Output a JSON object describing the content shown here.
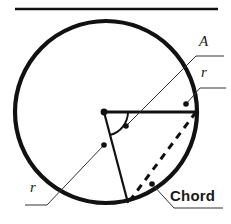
{
  "figure": {
    "background_color": "#ffffff",
    "stroke_color": "#111111",
    "labels": {
      "area": "A",
      "radius_top_right": "r",
      "radius_bottom_left": "r",
      "chord": "Chord"
    },
    "top_rule": {
      "x1": 15,
      "y1": 9,
      "x2": 218,
      "y2": 9,
      "stroke_width": 2.4
    },
    "circle": {
      "cx": 106,
      "cy": 112,
      "r": 91,
      "stroke_width": 4.2,
      "fill": "none"
    },
    "center_point": {
      "cx": 104,
      "cy": 112,
      "r": 3.4
    },
    "radii": [
      {
        "name": "horizontal-radius",
        "x1": 104,
        "y1": 112,
        "x2": 196,
        "y2": 112,
        "stroke_width": 3.2
      },
      {
        "name": "lower-radius",
        "x1": 104,
        "y1": 112,
        "x2": 128,
        "y2": 203,
        "stroke_width": 2.2
      }
    ],
    "angle_arc": {
      "path": "M 128 112 A 24 24 0 0 1 110 135",
      "stroke_width": 1.9
    },
    "chord": {
      "x1": 196,
      "y1": 112,
      "x2": 128,
      "y2": 203,
      "stroke_width": 3.0,
      "dash_pattern": "7 6"
    },
    "leaders": [
      {
        "name": "area-leader",
        "path": "M 126 126 L 196 56 L 224 56",
        "dot": {
          "cx": 126,
          "cy": 126,
          "r": 2.8
        },
        "stroke_width": 1.0
      },
      {
        "name": "radius-top-right-leader",
        "path": "M 186 104 L 200 88 L 226 88",
        "dot": {
          "cx": 186,
          "cy": 104,
          "r": 2.8
        },
        "stroke_width": 1.0
      },
      {
        "name": "radius-bottom-left-leader",
        "path": "M 104 145 L 47 205 L 25 205",
        "dot": {
          "cx": 104,
          "cy": 145,
          "r": 2.8
        },
        "stroke_width": 1.0
      },
      {
        "name": "chord-leader",
        "path": "M 152 184 L 174 208 L 223 208",
        "dot": {
          "cx": 152,
          "cy": 184,
          "r": 2.8
        },
        "stroke_width": 1.0
      }
    ]
  }
}
